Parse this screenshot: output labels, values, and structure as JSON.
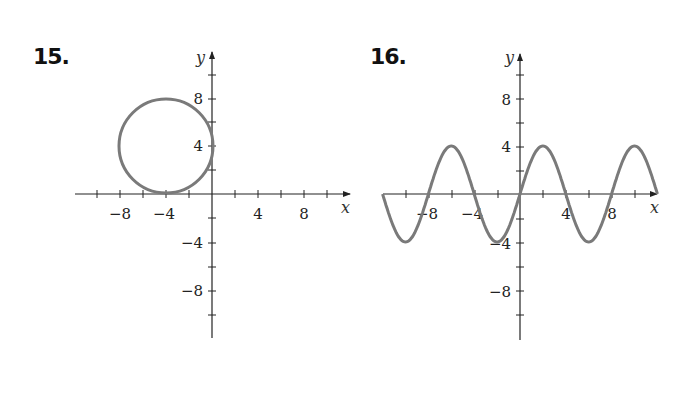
{
  "problems": [
    {
      "number": "15.",
      "x_axis_label": "x",
      "y_axis_label": "y",
      "x_ticks": [
        "−8",
        "−4",
        "4",
        "8"
      ],
      "y_ticks": [
        "8",
        "4",
        "−4",
        "−8"
      ]
    },
    {
      "number": "16.",
      "x_axis_label": "x",
      "y_axis_label": "y",
      "x_ticks": [
        "−8",
        "−4",
        "4",
        "8"
      ],
      "y_ticks": [
        "8",
        "4",
        "−4",
        "−8"
      ]
    }
  ],
  "colors": {
    "axis": "#222222",
    "curve": "#7a7a7a"
  },
  "chart_data": [
    {
      "type": "line",
      "title": "15.",
      "description": "Circle centered at (-4, 4) with radius 4",
      "shape": "circle",
      "center": [
        -4,
        4
      ],
      "radius": 4,
      "xlabel": "x",
      "ylabel": "y",
      "xlim": [
        -12,
        12
      ],
      "ylim": [
        -12,
        12
      ],
      "x_tick_labels": [
        -8,
        -4,
        4,
        8
      ],
      "y_tick_labels": [
        8,
        4,
        -4,
        -8
      ],
      "tick_step": 2,
      "grid": false
    },
    {
      "type": "line",
      "title": "16.",
      "description": "Sine wave y = 4 sin(pi x / 4), amplitude 4, period 8",
      "x": [
        -12,
        -10,
        -8,
        -6,
        -4,
        -2,
        0,
        2,
        4,
        6,
        8,
        10,
        12
      ],
      "y": [
        0,
        -4,
        0,
        4,
        0,
        -4,
        0,
        4,
        0,
        -4,
        0,
        4,
        0
      ],
      "xlabel": "x",
      "ylabel": "y",
      "xlim": [
        -12,
        12
      ],
      "ylim": [
        -12,
        12
      ],
      "x_tick_labels": [
        -8,
        -4,
        4,
        8
      ],
      "y_tick_labels": [
        8,
        4,
        -4,
        -8
      ],
      "tick_step": 2,
      "grid": false
    }
  ]
}
